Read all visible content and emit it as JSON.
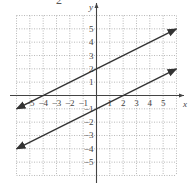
{
  "header": {
    "fragment": "2"
  },
  "chart_data": {
    "type": "line",
    "title": "",
    "xlabel": "x",
    "ylabel": "y",
    "xlim": [
      -6,
      6
    ],
    "ylim": [
      -6,
      6
    ],
    "grid": true,
    "grid_style": "dotted",
    "x_ticks": [
      -5,
      -4,
      -3,
      -2,
      -1,
      1,
      2,
      3,
      4,
      5
    ],
    "y_ticks": [
      -5,
      -4,
      -3,
      -2,
      -1,
      1,
      2,
      3,
      4,
      5
    ],
    "x_tick_labels": [
      "−5",
      "−4",
      "−3",
      "−2",
      "−1",
      "1",
      "2",
      "3",
      "4",
      "5"
    ],
    "y_tick_labels": [
      "−5",
      "−4",
      "−3",
      "−2",
      "−1",
      "1",
      "2",
      "3",
      "4",
      "5"
    ],
    "series": [
      {
        "name": "upper line",
        "equation": "y = x/2 + 2",
        "x": [
          -6,
          6
        ],
        "y": [
          -1,
          5
        ],
        "arrows": "both"
      },
      {
        "name": "lower line",
        "equation": "y = x/2 - 1",
        "x": [
          -6,
          6
        ],
        "y": [
          -4,
          2
        ],
        "arrows": "both"
      }
    ],
    "colors": {
      "line": "#333333",
      "axis": "#444444",
      "grid": "#999999"
    }
  }
}
